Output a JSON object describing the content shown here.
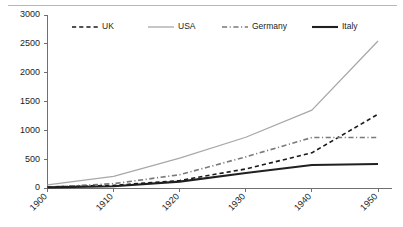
{
  "chart_data": {
    "type": "line",
    "title": "",
    "subtitle": "",
    "xlabel": "",
    "ylabel": "",
    "x": [
      1900,
      1910,
      1920,
      1930,
      1940,
      1950
    ],
    "categories": [
      "1900",
      "1910",
      "1920",
      "1930",
      "1940",
      "1950"
    ],
    "xlim": [
      1900,
      1950
    ],
    "ylim": [
      0,
      3000
    ],
    "ytick_labels": [
      "0",
      "500",
      "1000",
      "1500",
      "2000",
      "2500",
      "3000"
    ],
    "ytick_values": [
      0,
      500,
      1000,
      1500,
      2000,
      2500,
      3000
    ],
    "xtick_labels": [
      "1900",
      "1910",
      "1920",
      "1930",
      "1940",
      "1950"
    ],
    "xtick_rotation": 45,
    "grid": false,
    "legend_position": "top",
    "series": [
      {
        "name": "UK",
        "values": [
          20,
          45,
          130,
          330,
          610,
          1280
        ],
        "style": "dashed",
        "color": "#1a1a1a",
        "width": 1.6
      },
      {
        "name": "USA",
        "values": [
          55,
          200,
          520,
          880,
          1350,
          2550
        ],
        "style": "solid",
        "color": "#a8a8a8",
        "width": 1.3
      },
      {
        "name": "Germany",
        "values": [
          15,
          75,
          230,
          540,
          875,
          875
        ],
        "style": "dashdot",
        "color": "#7a7a7a",
        "width": 1.6
      },
      {
        "name": "Italy",
        "values": [
          10,
          30,
          110,
          260,
          400,
          415
        ],
        "style": "solid",
        "color": "#202020",
        "width": 2.1
      }
    ]
  },
  "legend": {
    "items": [
      {
        "label": "UK"
      },
      {
        "label": "USA"
      },
      {
        "label": "Germany"
      },
      {
        "label": "Italy"
      }
    ]
  },
  "colors": {
    "axis": "#6f6f6f",
    "text": "#1d1d1d",
    "background": "#ffffff",
    "top_rule": "#b8b8b8"
  }
}
